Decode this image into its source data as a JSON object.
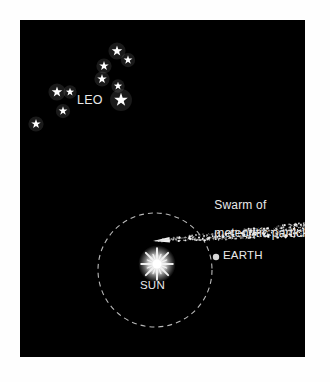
{
  "figure": {
    "name": "leonid-meteor-shower-diagram",
    "background_color": "#ffffff",
    "panel_color": "#000000",
    "text_color": "#e9e9e9"
  },
  "labels": {
    "constellation": "LEO",
    "swarm_line1": "Swarm of",
    "swarm_line2": "meteoritic particles",
    "sun": "SUN",
    "earth": "EARTH"
  },
  "constellation": {
    "name": "LEO",
    "star_color": "#ffffff",
    "stars": [
      {
        "name": "star-regulus",
        "x": 121,
        "y": 100,
        "size": 11.5
      },
      {
        "name": "star-denebola",
        "x": 36,
        "y": 124,
        "size": 8.0
      },
      {
        "name": "star-algieba",
        "x": 117,
        "y": 51,
        "size": 9.0
      },
      {
        "name": "star-zosma",
        "x": 128,
        "y": 60,
        "size": 7.5
      },
      {
        "name": "star-adhafera",
        "x": 104,
        "y": 66,
        "size": 8.0
      },
      {
        "name": "star-rasalas",
        "x": 102,
        "y": 79,
        "size": 8.0
      },
      {
        "name": "star-chort",
        "x": 118,
        "y": 86,
        "size": 7.0
      },
      {
        "name": "star-theta-leo",
        "x": 57,
        "y": 92,
        "size": 9.0
      },
      {
        "name": "star-iota-leo",
        "x": 70,
        "y": 92,
        "size": 7.0
      },
      {
        "name": "star-sigma-leo",
        "x": 63,
        "y": 111,
        "size": 7.5
      }
    ]
  },
  "orbit": {
    "name": "earth-orbit",
    "center_x": 155,
    "center_y": 270,
    "radius": 57,
    "style": "dashed",
    "color": "#b9b9b9"
  },
  "sun": {
    "name": "sun",
    "x": 157,
    "y": 264,
    "radius": 15,
    "color": "#f0f0f0",
    "rays": 16
  },
  "earth": {
    "name": "earth",
    "x": 216,
    "y": 257,
    "radius": 3.2,
    "color": "#d8d8d8"
  },
  "swarm": {
    "name": "meteoritic-particle-swarm",
    "particle_color": "#ffffff",
    "particle_count": 560,
    "arrow_tip_x": 153,
    "arrow_tip_y": 241,
    "tail_end_x": 312,
    "tail_end_y": 229,
    "direction": "right-to-left toward sun"
  }
}
